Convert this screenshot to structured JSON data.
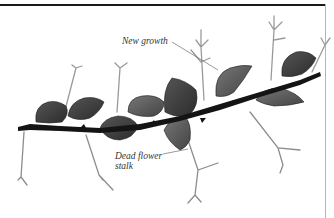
{
  "figure": {
    "labels": {
      "new_growth": "New growth",
      "dead_flower_stalk": "Dead flower stalk"
    },
    "colors": {
      "stem": "#141414",
      "leaf_dark": "#3a3a3a",
      "leaf_mid": "#6a6a6a",
      "stalk": "#9a9a9a",
      "leader_line": "#555555",
      "top_rule": "#1a1a1a",
      "right_rule": "#b5b5b5"
    }
  }
}
